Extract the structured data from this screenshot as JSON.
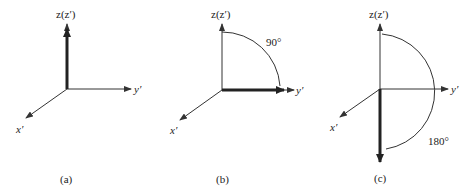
{
  "figure": {
    "panels": [
      {
        "id": "a",
        "caption": "(a)",
        "axes": {
          "z": "z(z′)",
          "y": "y′",
          "x": "x′"
        },
        "vector": "along +z",
        "angle_label": ""
      },
      {
        "id": "b",
        "caption": "(b)",
        "axes": {
          "z": "z(z′)",
          "y": "y′",
          "x": "x′"
        },
        "vector": "along +y′",
        "angle_label": "90°"
      },
      {
        "id": "c",
        "caption": "(c)",
        "axes": {
          "z": "z(z′)",
          "y": "y′",
          "x": "x′"
        },
        "vector": "along −z",
        "angle_label": "180°"
      }
    ],
    "colors": {
      "line": "#333333",
      "vector": "#222222",
      "background": "#ffffff"
    }
  }
}
